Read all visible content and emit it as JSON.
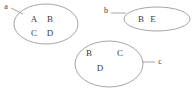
{
  "diagram": {
    "type": "set-diagram",
    "background_color": "#ffffff",
    "stroke_color": "#9a9a9a",
    "text_color": "#3b3b3b",
    "sets": [
      {
        "label": "a",
        "label_x": 6,
        "label_y": 9,
        "ellipse": {
          "cx": 46,
          "cy": 24,
          "rx": 32,
          "ry": 20
        },
        "leader": {
          "x1": 11,
          "y1": 8,
          "x2": 23,
          "y2": 14
        },
        "elements": [
          {
            "text": "A",
            "x": 34,
            "y": 22
          },
          {
            "text": "B",
            "x": 50,
            "y": 22
          },
          {
            "text": "C",
            "x": 34,
            "y": 36
          },
          {
            "text": "D",
            "x": 50,
            "y": 36
          }
        ]
      },
      {
        "label": "b",
        "label_x": 106,
        "label_y": 13,
        "ellipse": {
          "cx": 157,
          "cy": 19,
          "rx": 33,
          "ry": 12
        },
        "leader": {
          "x1": 111,
          "y1": 13,
          "x2": 126,
          "y2": 13
        },
        "elements": [
          {
            "text": "B",
            "x": 141,
            "y": 22
          },
          {
            "text": "E",
            "x": 153,
            "y": 22
          }
        ]
      },
      {
        "label": "c",
        "label_x": 160,
        "label_y": 64,
        "ellipse": {
          "cx": 109,
          "cy": 64,
          "rx": 34,
          "ry": 23
        },
        "leader": {
          "x1": 142,
          "y1": 62,
          "x2": 155,
          "y2": 62
        },
        "elements": [
          {
            "text": "B",
            "x": 89,
            "y": 56
          },
          {
            "text": "C",
            "x": 120,
            "y": 56
          },
          {
            "text": "D",
            "x": 100,
            "y": 71
          }
        ]
      }
    ]
  }
}
